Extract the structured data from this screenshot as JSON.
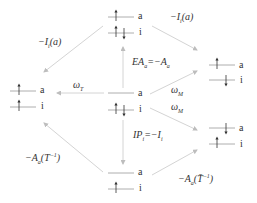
{
  "diagram": {
    "type": "energy-level transition diagram",
    "colors": {
      "level_line": "#9a9a9a",
      "arrow": "#cfcfcf",
      "spin": "#333333",
      "text": "#333333"
    },
    "states": [
      {
        "id": "top",
        "levels": [
          {
            "name": "a",
            "spins": [
              "up"
            ]
          },
          {
            "name": "i",
            "spins": [
              "up",
              "down"
            ]
          }
        ]
      },
      {
        "id": "left",
        "levels": [
          {
            "name": "a",
            "spins": [
              "up"
            ]
          },
          {
            "name": "i",
            "spins": [
              "up"
            ]
          }
        ]
      },
      {
        "id": "center",
        "levels": [
          {
            "name": "a",
            "spins": []
          },
          {
            "name": "i",
            "spins": [
              "up",
              "down"
            ]
          }
        ]
      },
      {
        "id": "right-upper",
        "levels": [
          {
            "name": "a",
            "spins": [
              "up"
            ]
          },
          {
            "name": "i",
            "spins": [
              "down"
            ]
          }
        ]
      },
      {
        "id": "right-lower",
        "levels": [
          {
            "name": "a",
            "spins": [
              "down"
            ]
          },
          {
            "name": "i",
            "spins": [
              "up"
            ]
          }
        ]
      },
      {
        "id": "bottom",
        "levels": [
          {
            "name": "a",
            "spins": []
          },
          {
            "name": "i",
            "spins": [
              "up"
            ]
          }
        ]
      }
    ],
    "labels": {
      "orb_a": "a",
      "orb_i": "i",
      "top_left": "−I",
      "top_left_sub": "i",
      "top_left_arg": "(a)",
      "top_right": "−I",
      "top_right_sub": "i",
      "top_right_arg": "(a)",
      "omega_T": "ω",
      "omega_T_sub": "T",
      "omega_M_upper": "ω",
      "omega_M_upper_sub": "M",
      "omega_M_lower": "ω",
      "omega_M_lower_sub": "M",
      "EA": "EA",
      "EA_sub": "a",
      "EA_eq": "=−A",
      "EA_eq_sub": "a",
      "IP": "IP",
      "IP_sub": "i",
      "IP_eq": "=−I",
      "IP_eq_sub": "i",
      "bottom_left": "−A",
      "bottom_left_sub": "a",
      "bottom_left_arg": "(T",
      "bottom_left_sup": "−1",
      "bottom_left_close": ")",
      "bottom_right": "−A",
      "bottom_right_sub": "a",
      "bottom_right_arg": "(T̄",
      "bottom_right_sup": "−1",
      "bottom_right_close": ")"
    }
  }
}
